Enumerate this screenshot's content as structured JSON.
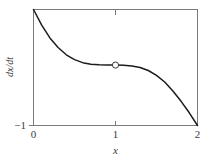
{
  "chart_data": {
    "type": "line",
    "title": "",
    "xlabel": "x",
    "ylabel": "dx/dt",
    "xlim": [
      0,
      2
    ],
    "ylim": [
      -1,
      0.92
    ],
    "grid": false,
    "legend": null,
    "xticks": [
      0,
      1,
      2
    ],
    "xticklabels": [
      "0",
      "1",
      "2"
    ],
    "yticks": [
      -1
    ],
    "yticklabels": [
      "-1"
    ],
    "series": [
      {
        "name": "dx/dt",
        "comment": "cubic-like curve with inflection / semi-stable point at x=1",
        "x": [
          0.0,
          0.1,
          0.2,
          0.3,
          0.4,
          0.5,
          0.6,
          0.7,
          0.8,
          0.9,
          1.0,
          1.1,
          1.2,
          1.3,
          1.4,
          1.5,
          1.6,
          1.7,
          1.8,
          1.9,
          2.0
        ],
        "y": [
          0.92,
          0.66,
          0.45,
          0.29,
          0.17,
          0.09,
          0.04,
          0.015,
          0.004,
          0.0,
          0.0,
          -0.004,
          -0.015,
          -0.04,
          -0.09,
          -0.17,
          -0.28,
          -0.43,
          -0.6,
          -0.79,
          -1.0
        ]
      }
    ],
    "annotations": [
      {
        "name": "equilibrium-marker",
        "kind": "open-circle",
        "x": 1.0,
        "y": 0.0,
        "label": ""
      }
    ]
  },
  "labels": {
    "x_axis": "x",
    "y_axis": "dx/dt",
    "y_axis_num": "dx",
    "y_axis_den": "dt",
    "tick_x_0": "0",
    "tick_x_1": "1",
    "tick_x_2": "2",
    "tick_y_min": "−1"
  },
  "colors": {
    "curve": "#1c1c1c",
    "axis": "#7a7a7a",
    "text": "#3b3b3b",
    "background": "#ffffff",
    "marker_edge": "#3a3a3a",
    "marker_fill": "#ffffff"
  }
}
